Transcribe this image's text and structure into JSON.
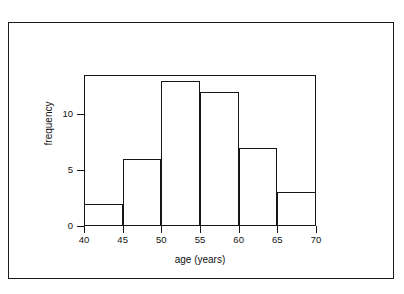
{
  "figure": {
    "background_color": "#ffffff",
    "line_color": "#161616",
    "border_color": "#1b1b1b"
  },
  "chart_data": {
    "type": "bar",
    "title": "",
    "subtitle": "",
    "xlabel": "age (years)",
    "ylabel": "frequency",
    "categories": [
      "40-45",
      "45-50",
      "50-55",
      "55-60",
      "60-65",
      "65-70"
    ],
    "bin_edges": [
      40,
      45,
      50,
      55,
      60,
      65,
      70
    ],
    "bin_width": 5,
    "values": [
      2,
      6,
      13,
      12,
      7,
      3
    ],
    "x": [
      40,
      45,
      50,
      55,
      60,
      65
    ],
    "xlim": [
      40,
      70
    ],
    "ylim": [
      0,
      13.5
    ],
    "xticks": [
      40,
      45,
      50,
      55,
      60,
      65,
      70
    ],
    "xtick_labels": [
      "40",
      "45",
      "50",
      "55",
      "60",
      "65",
      "70"
    ],
    "yticks": [
      0,
      5,
      10
    ],
    "ytick_labels": [
      "0",
      "5",
      "10"
    ],
    "grid": false,
    "legend": null,
    "legend_position": "none",
    "bar_fill": "#ffffff",
    "bar_edge": "#161616",
    "annotations": []
  }
}
